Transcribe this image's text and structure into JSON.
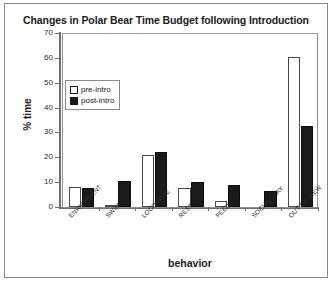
{
  "chart_data": {
    "type": "bar",
    "title": "Changes in Polar Bear Time Budget following Introduction",
    "xlabel": "behavior",
    "ylabel": "% time",
    "ylim": [
      0,
      70
    ],
    "yticks": [
      0,
      10,
      20,
      30,
      40,
      50,
      60,
      70
    ],
    "grid": false,
    "legend_position": "upper-left-inside",
    "categories": [
      "ENRICHMENT",
      "SWIM",
      "LOCOMOTE",
      "REST",
      "FEED",
      "SOCIAL PLAY",
      "OUT OF VIEW"
    ],
    "series": [
      {
        "name": "pre-intro",
        "color": "#ffffff",
        "values": [
          8,
          0.5,
          21,
          7.5,
          2.5,
          0,
          60.5
        ]
      },
      {
        "name": "post-intro",
        "color": "#1a1a1a",
        "values": [
          7.5,
          10.5,
          22,
          10,
          9,
          6.5,
          32.5
        ]
      }
    ]
  }
}
